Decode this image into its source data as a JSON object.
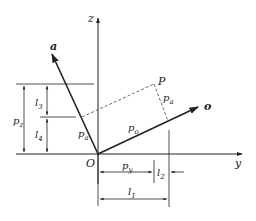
{
  "diagram": {
    "title": "",
    "axes": {
      "z": "z",
      "y": "y",
      "origin": "O"
    },
    "vectors": {
      "a": "a",
      "o": "o"
    },
    "point": "P",
    "components": {
      "pa_perp": "p",
      "pa_perp_sub": "a",
      "pa_along": "p",
      "pa_along_sub": "a",
      "po": "p",
      "po_sub": "o"
    },
    "dimensions": {
      "pz": "p",
      "pz_sub": "z",
      "l3": "l",
      "l3_sub": "3",
      "l4": "l",
      "l4_sub": "4",
      "py": "p",
      "py_sub": "y",
      "l2": "l",
      "l2_sub": "2",
      "l1": "l",
      "l1_sub": "1"
    },
    "colors": {
      "line": "#222222",
      "dashed": "#444444"
    }
  }
}
